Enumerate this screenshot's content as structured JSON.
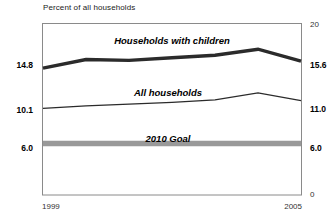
{
  "chart_data": {
    "type": "line",
    "title": "Percent of all households",
    "xlabel": "",
    "ylabel": "",
    "x": [
      1999,
      2000,
      2001,
      2002,
      2003,
      2004,
      2005
    ],
    "xlim": [
      1999,
      2005
    ],
    "ylim": [
      0,
      20
    ],
    "grid": false,
    "legend": "inline-annotations",
    "series": [
      {
        "name": "Households with children",
        "values": [
          14.8,
          15.8,
          15.7,
          16.0,
          16.3,
          17.0,
          15.6
        ],
        "style": "thick-solid",
        "color": "#2b2b2b"
      },
      {
        "name": "All households",
        "values": [
          10.1,
          10.4,
          10.6,
          10.8,
          11.1,
          11.9,
          11.0
        ],
        "style": "thin-solid",
        "color": "#2b2b2b"
      },
      {
        "name": "2010 Goal",
        "values": [
          6.0,
          6.0,
          6.0,
          6.0,
          6.0,
          6.0,
          6.0
        ],
        "style": "thick-gray-band",
        "color": "#999999"
      }
    ],
    "left_axis_ticks": [
      "14.8",
      "10.1",
      "6.0"
    ],
    "right_axis_ticks": [
      "20",
      "15.6",
      "11.0",
      "6.0",
      "0"
    ],
    "x_tick_labels": [
      "1999",
      "2005"
    ],
    "annotations": [
      {
        "text": "Households with children",
        "value": 17.4
      },
      {
        "text": "All households",
        "value": 12.4
      },
      {
        "text": "2010 Goal",
        "value": 7.5
      }
    ]
  },
  "axis": {
    "left": {
      "t0": "14.8",
      "t1": "10.1",
      "t2": "6.0"
    },
    "right": {
      "t0": "20",
      "t1": "15.6",
      "t2": "11.0",
      "t3": "6.0",
      "t4": "0"
    },
    "x": {
      "start": "1999",
      "end": "2005"
    }
  },
  "annotations": {
    "series1": "Households with children",
    "series2": "All households",
    "series3": "2010 Goal"
  },
  "colors": {
    "frame": "#8a8a8a",
    "line_dark": "#2b2b2b",
    "goal_gray": "#999999",
    "text": "#1a1a1a"
  }
}
